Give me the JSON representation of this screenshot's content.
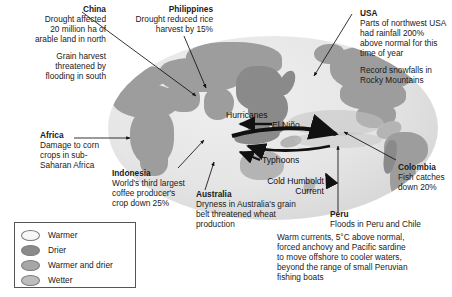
{
  "colors": {
    "land": "#9d9d9d",
    "land_dark": "#8a8a8a",
    "land_light": "#b4b4b4",
    "ocean": "#e6e6e6",
    "arrow": "#111111",
    "text": "#1a1a1a",
    "legend_border": "#555555",
    "swatch_warmer": "#f7f7f7",
    "swatch_drier": "#8a8a8a",
    "swatch_warmer_drier": "#a6a6a6",
    "swatch_wetter": "#bdbdbd"
  },
  "callouts": [
    {
      "id": "china",
      "heading": "China",
      "paragraphs": [
        "Drought affected\n20 million ha of\narable land in north",
        "Grain harvest\nthreatened by\nflooding in south"
      ],
      "align": "right"
    },
    {
      "id": "philippines",
      "heading": "Philippines",
      "paragraphs": [
        "Drought reduced rice\nharvest by 15%"
      ],
      "align": "right"
    },
    {
      "id": "usa",
      "heading": "USA",
      "paragraphs": [
        "Parts of northwest USA\nhad rainfall 200%\nabove normal for this\ntime of year",
        "Record snowfalls in\nRocky Mountains"
      ],
      "align": "left"
    },
    {
      "id": "africa",
      "heading": "Africa",
      "paragraphs": [
        "Damage to corn\ncrops in sub-\nSaharan Africa"
      ],
      "align": "left"
    },
    {
      "id": "indonesia",
      "heading": "Indonesia",
      "paragraphs": [
        "World's third largest\ncoffee producer's\ncrop down 25%"
      ],
      "align": "left"
    },
    {
      "id": "australia",
      "heading": "Australia",
      "paragraphs": [
        "Dryness in Australia's grain\nbelt threatened wheat\nproduction"
      ],
      "align": "left"
    },
    {
      "id": "colombia",
      "heading": "Colombia",
      "paragraphs": [
        "Fish catches\ndown 20%"
      ],
      "align": "left"
    },
    {
      "id": "peru",
      "heading": "Peru",
      "paragraphs": [
        "Floods in Peru and Chile"
      ],
      "align": "left"
    }
  ],
  "peru_note": {
    "text": "Warm currents, 5°C above normal,\nforced anchovy and Pacific sardine\nto move offshore to cooler waters,\nbeyond the range of small Peruvian\nfishing boats"
  },
  "map_labels": [
    {
      "id": "hurricanes",
      "text": "Hurricanes"
    },
    {
      "id": "el-nino",
      "text": "El Niño"
    },
    {
      "id": "typhoons",
      "text": "Typhoons"
    },
    {
      "id": "cold-humboldt-current",
      "text": "Cold Humboldt\nCurrent"
    }
  ],
  "legend": {
    "items": [
      {
        "label": "Warmer",
        "color": "#f7f7f7"
      },
      {
        "label": "Drier",
        "color": "#8a8a8a"
      },
      {
        "label": "Warmer and drier",
        "color": "#a6a6a6"
      },
      {
        "label": "Wetter",
        "color": "#bdbdbd"
      }
    ]
  }
}
